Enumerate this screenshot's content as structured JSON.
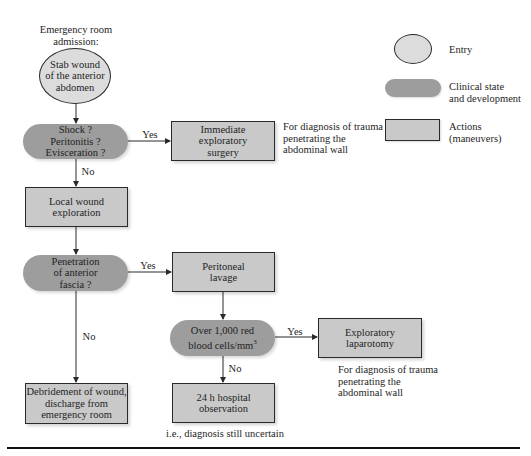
{
  "diagram": {
    "entry_caption": "Emergency room\nadmission:",
    "nodes": {
      "stab_wound": "Stab wound\nof the anterior\nabdomen",
      "shock": "Shock ?\nPeritonitis ?\nEvisceration ?",
      "immediate_surgery": "Immediate\nexploratory\nsurgery",
      "local_wound": "Local wound\nexploration",
      "penetration": "Penetration\nof anterior\nfascia ?",
      "peritoneal_lavage": "Peritoneal\nlavage",
      "rbc": "Over 1,000 red\nblood cells/mm",
      "rbc_sup": "3",
      "exploratory_laparotomy": "Exploratory\nlaparotomy",
      "debridement": "Debridement of wound,\ndischarge from\nemergency room",
      "observation": "24 h hospital\nobservation"
    },
    "edge_labels": {
      "shock_yes": "Yes",
      "shock_no": "No",
      "penetration_yes": "Yes",
      "penetration_no": "No",
      "rbc_yes": "Yes",
      "rbc_no": "No"
    },
    "notes": {
      "surgery_note": "For diagnosis of trauma\npenetrating the\nabdominal wall",
      "laparotomy_note": "For diagnosis of trauma\npenetrating the\nabdominal wall",
      "observation_note": "i.e., diagnosis still uncertain"
    }
  },
  "legend": {
    "items": [
      {
        "shape": "ellipse",
        "label": "Entry"
      },
      {
        "shape": "rounded-pill",
        "label": "Clinical state\nand development"
      },
      {
        "shape": "rectangle",
        "label": "Actions\n(maneuvers)"
      }
    ]
  },
  "colors": {
    "action_fill": "#c9c9c9",
    "state_fill": "#9d9d9d",
    "entry_fill": "#dcdcdc",
    "line": "#2a2a2a"
  }
}
